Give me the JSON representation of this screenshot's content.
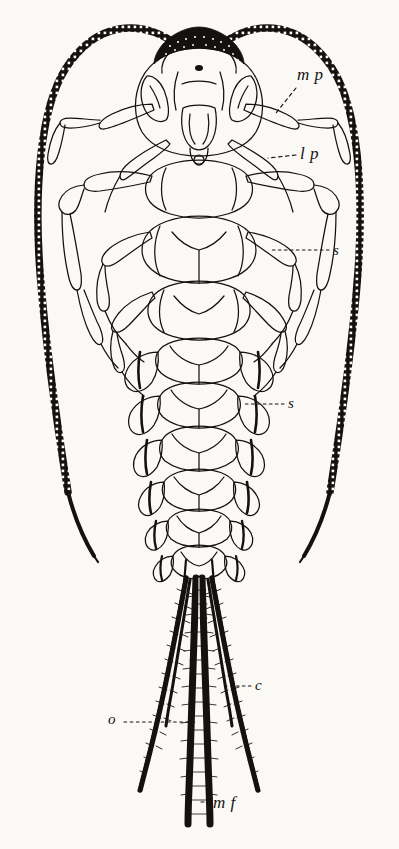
{
  "figure": {
    "kind": "scientific-illustration",
    "technique": "ink line engraving",
    "background_color": "#fbfaf7",
    "ink_color": "#141210"
  },
  "labels": [
    {
      "id": "mp",
      "text": "m p",
      "meaning": "maxillary palp",
      "x": 297,
      "y": 66,
      "leader": "dashed"
    },
    {
      "id": "lp",
      "text": "l p",
      "meaning": "labial palp",
      "x": 300,
      "y": 145,
      "leader": "dashed"
    },
    {
      "id": "s1",
      "text": "s",
      "meaning": "spiracle",
      "x": 333,
      "y": 243,
      "leader": "dotted"
    },
    {
      "id": "s2",
      "text": "s",
      "meaning": "spiracle",
      "x": 288,
      "y": 396,
      "leader": "dotted"
    },
    {
      "id": "c",
      "text": "c",
      "meaning": "cercus",
      "x": 255,
      "y": 678,
      "leader": "dotted"
    },
    {
      "id": "o",
      "text": "o",
      "meaning": "outer filament",
      "x": 108,
      "y": 712,
      "leader": "dotted"
    },
    {
      "id": "mf",
      "text": "m f",
      "meaning": "median filament",
      "x": 213,
      "y": 794,
      "leader": "dashed"
    }
  ],
  "anatomy": {
    "head": "head capsule with dark stippled transverse band",
    "antennae": "pair of long multi-segmented antennae arcing outward",
    "legs": "three pairs of jointed legs in outline",
    "abdomen": "ten segments with chevron markings and lateral gills",
    "tails": "three caudal filaments, setae-fringed"
  }
}
